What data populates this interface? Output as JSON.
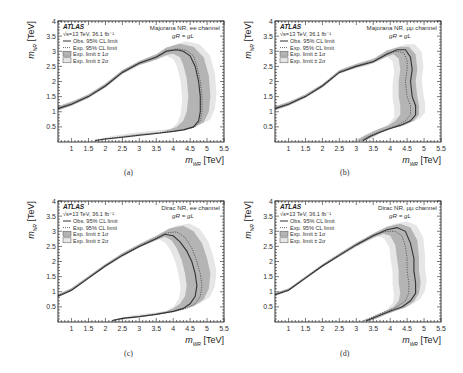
{
  "figure": {
    "captions": [
      "(a)",
      "(b)",
      "(c)",
      "(d)"
    ]
  },
  "common": {
    "experiment": "ATLAS",
    "energy_lumi": "√s=13 TeV, 36.1 fb⁻¹",
    "legend": [
      {
        "key": "obs",
        "label": "Obs. 95% CL limit",
        "style": "solid-line"
      },
      {
        "key": "exp",
        "label": "Exp. 95% CL limit",
        "style": "dotted-line"
      },
      {
        "key": "band1",
        "label": "Exp. limit ± 1σ",
        "style": "dark-box"
      },
      {
        "key": "band2",
        "label": "Exp. limit ± 2σ",
        "style": "light-box"
      }
    ],
    "coupling": "g_R = g_L",
    "coupling_display": "gR = gL",
    "xlabel": "m_{W_R} [TeV]",
    "ylabel": "m_{N_R} [TeV]",
    "xlabel_main": "m",
    "xlabel_sub": "WR",
    "xlabel_unit": "[TeV]",
    "ylabel_main": "m",
    "ylabel_sub": "NR",
    "ylabel_unit": "[TeV]",
    "colors": {
      "band1": "#b4b4b4",
      "band2": "#e6e6e6",
      "obs": "#333333",
      "exp": "#555555",
      "frame": "#222222"
    }
  },
  "chart_data": [
    {
      "type": "line",
      "panel": "(a)",
      "title": "Majorana N_R, ee channel",
      "title_display": "Majorana NR, ee channel",
      "xlabel": "m_{W_R} [TeV]",
      "ylabel": "m_{N_R} [TeV]",
      "xlim": [
        0.6,
        5.5
      ],
      "ylim": [
        0,
        4
      ],
      "xticks": [
        1,
        1.5,
        2,
        2.5,
        3,
        3.5,
        4,
        4.5,
        5,
        5.5
      ],
      "yticks": [
        0.5,
        1,
        1.5,
        2,
        2.5,
        3,
        3.5,
        4
      ],
      "grid": false,
      "legend_position": "upper-left",
      "series": [
        {
          "name": "Obs. 95% CL limit",
          "x": [
            0.6,
            1.0,
            1.5,
            2.0,
            2.5,
            3.0,
            3.5,
            3.8,
            4.1,
            4.3,
            4.5,
            4.65,
            4.75,
            4.8,
            4.8,
            4.75,
            4.6,
            4.3,
            4.0,
            3.5,
            3.0,
            2.5,
            2.0,
            1.7
          ],
          "y": [
            1.1,
            1.25,
            1.5,
            1.85,
            2.3,
            2.6,
            2.8,
            3.0,
            3.05,
            3.0,
            2.85,
            2.5,
            2.0,
            1.5,
            1.0,
            0.7,
            0.5,
            0.4,
            0.35,
            0.28,
            0.22,
            0.16,
            0.1,
            0.05
          ]
        },
        {
          "name": "Exp. 95% CL limit",
          "x": [
            0.6,
            1.0,
            1.5,
            2.0,
            2.5,
            3.0,
            3.5,
            3.8,
            4.15,
            4.4,
            4.6,
            4.7,
            4.8,
            4.85,
            4.85,
            4.8,
            4.65,
            4.35,
            4.0,
            3.5,
            3.0,
            2.5,
            2.0,
            1.7
          ],
          "y": [
            1.12,
            1.27,
            1.52,
            1.87,
            2.32,
            2.62,
            2.82,
            3.02,
            3.08,
            3.02,
            2.85,
            2.5,
            2.0,
            1.5,
            1.0,
            0.7,
            0.5,
            0.4,
            0.36,
            0.29,
            0.23,
            0.17,
            0.11,
            0.06
          ]
        },
        {
          "name": "Exp. limit ± 1σ",
          "lower_x": [
            0.6,
            1.0,
            1.5,
            2.0,
            2.5,
            3.0,
            3.5,
            3.8,
            4.0,
            4.2,
            4.3,
            4.4,
            4.45,
            4.4,
            4.3,
            4.1,
            3.9,
            3.5,
            3.0,
            2.5,
            2.0,
            1.8
          ],
          "lower_y": [
            1.05,
            1.2,
            1.45,
            1.8,
            2.25,
            2.55,
            2.72,
            2.88,
            2.92,
            2.8,
            2.55,
            2.1,
            1.5,
            1.0,
            0.7,
            0.5,
            0.42,
            0.3,
            0.24,
            0.18,
            0.12,
            0.07
          ],
          "upper_x": [
            0.6,
            1.0,
            1.5,
            2.0,
            2.5,
            3.0,
            3.5,
            3.8,
            4.2,
            4.6,
            4.9,
            5.05,
            5.1,
            5.05,
            4.9,
            4.6,
            4.2,
            3.6,
            3.0,
            2.5,
            2.0,
            1.7
          ],
          "upper_y": [
            1.18,
            1.33,
            1.58,
            1.93,
            2.38,
            2.68,
            2.9,
            3.12,
            3.25,
            3.15,
            2.8,
            2.2,
            1.5,
            1.0,
            0.65,
            0.48,
            0.4,
            0.33,
            0.27,
            0.2,
            0.12,
            0.04
          ]
        }
      ]
    },
    {
      "type": "line",
      "panel": "(b)",
      "title": "Majorana N_R, μμ channel",
      "title_display": "Majorana NR, μμ channel",
      "xlabel": "m_{W_R} [TeV]",
      "ylabel": "m_{N_R} [TeV]",
      "xlim": [
        0.6,
        5.5
      ],
      "ylim": [
        0,
        4
      ],
      "xticks": [
        1,
        1.5,
        2,
        2.5,
        3,
        3.5,
        4,
        4.5,
        5,
        5.5
      ],
      "yticks": [
        0.5,
        1,
        1.5,
        2,
        2.5,
        3,
        3.5,
        4
      ],
      "grid": false,
      "legend_position": "upper-left",
      "series": [
        {
          "name": "Obs. 95% CL limit",
          "x": [
            0.6,
            1.0,
            1.5,
            2.0,
            2.5,
            3.0,
            3.5,
            3.9,
            4.2,
            4.45,
            4.6,
            4.65,
            4.6,
            4.65,
            4.75,
            4.75,
            4.6,
            4.3,
            4.0,
            3.7,
            3.4,
            3.2
          ],
          "y": [
            1.1,
            1.25,
            1.5,
            1.85,
            2.3,
            2.5,
            2.65,
            2.9,
            3.05,
            3.05,
            2.8,
            2.4,
            2.0,
            1.5,
            1.2,
            0.9,
            0.7,
            0.55,
            0.45,
            0.32,
            0.18,
            0.05
          ]
        },
        {
          "name": "Exp. 95% CL limit",
          "x": [
            0.6,
            1.0,
            1.5,
            2.0,
            2.5,
            3.0,
            3.5,
            3.9,
            4.2,
            4.4,
            4.5,
            4.5,
            4.45,
            4.5,
            4.6,
            4.6,
            4.45,
            4.2,
            3.95,
            3.65,
            3.35,
            3.15
          ],
          "y": [
            1.12,
            1.27,
            1.52,
            1.87,
            2.32,
            2.52,
            2.67,
            2.92,
            3.0,
            2.95,
            2.7,
            2.4,
            2.0,
            1.5,
            1.2,
            0.9,
            0.7,
            0.55,
            0.45,
            0.32,
            0.18,
            0.05
          ]
        },
        {
          "name": "Exp. limit ± 1σ",
          "lower_x": [
            0.6,
            1.0,
            1.5,
            2.0,
            2.5,
            3.0,
            3.5,
            3.9,
            4.1,
            4.25,
            4.3,
            4.25,
            4.25,
            4.3,
            4.3,
            4.15,
            3.95,
            3.7,
            3.45,
            3.2,
            3.0
          ],
          "lower_y": [
            1.06,
            1.2,
            1.46,
            1.8,
            2.26,
            2.46,
            2.6,
            2.82,
            2.9,
            2.75,
            2.4,
            2.0,
            1.5,
            1.2,
            0.9,
            0.7,
            0.55,
            0.45,
            0.32,
            0.18,
            0.05
          ],
          "upper_x": [
            0.6,
            1.0,
            1.5,
            2.0,
            2.5,
            3.0,
            3.5,
            3.9,
            4.3,
            4.55,
            4.75,
            4.8,
            4.75,
            4.8,
            4.85,
            4.85,
            4.7,
            4.4,
            4.05,
            3.75,
            3.5,
            3.3
          ],
          "upper_y": [
            1.18,
            1.32,
            1.58,
            1.92,
            2.38,
            2.58,
            2.74,
            3.02,
            3.15,
            3.15,
            2.9,
            2.4,
            2.0,
            1.5,
            1.2,
            0.9,
            0.7,
            0.55,
            0.45,
            0.32,
            0.18,
            0.05
          ]
        }
      ]
    },
    {
      "type": "line",
      "panel": "(c)",
      "title": "Dirac N_R, ee channel",
      "title_display": "Dirac NR, ee channel",
      "xlabel": "m_{W_R} [TeV]",
      "ylabel": "m_{N_R} [TeV]",
      "xlim": [
        0.6,
        5.5
      ],
      "ylim": [
        0,
        4
      ],
      "xticks": [
        1,
        1.5,
        2,
        2.5,
        3,
        3.5,
        4,
        4.5,
        5,
        5.5
      ],
      "yticks": [
        0.5,
        1,
        1.5,
        2,
        2.5,
        3,
        3.5,
        4
      ],
      "grid": false,
      "legend_position": "upper-left",
      "series": [
        {
          "name": "Obs. 95% CL limit",
          "x": [
            0.6,
            1.0,
            1.5,
            2.0,
            2.5,
            3.0,
            3.5,
            3.75,
            4.0,
            4.2,
            4.4,
            4.55,
            4.65,
            4.7,
            4.65,
            4.5,
            4.3,
            4.0,
            3.5,
            3.0,
            2.5,
            2.2
          ],
          "y": [
            0.85,
            1.05,
            1.45,
            1.85,
            2.2,
            2.5,
            2.75,
            2.9,
            2.85,
            2.65,
            2.35,
            2.0,
            1.6,
            1.2,
            0.85,
            0.6,
            0.45,
            0.35,
            0.25,
            0.18,
            0.12,
            0.05
          ]
        },
        {
          "name": "Exp. 95% CL limit",
          "x": [
            0.6,
            1.0,
            1.5,
            2.0,
            2.5,
            3.0,
            3.5,
            3.8,
            4.1,
            4.35,
            4.55,
            4.7,
            4.8,
            4.85,
            4.8,
            4.65,
            4.4,
            4.05,
            3.55,
            3.05,
            2.55,
            2.25
          ],
          "y": [
            0.87,
            1.07,
            1.47,
            1.87,
            2.22,
            2.52,
            2.78,
            2.95,
            2.98,
            2.8,
            2.45,
            2.0,
            1.6,
            1.2,
            0.85,
            0.6,
            0.45,
            0.35,
            0.26,
            0.19,
            0.13,
            0.06
          ]
        },
        {
          "name": "Exp. limit ± 1σ",
          "lower_x": [
            0.6,
            1.0,
            1.5,
            2.0,
            2.5,
            3.0,
            3.5,
            3.75,
            3.95,
            4.1,
            4.25,
            4.35,
            4.4,
            4.35,
            4.2,
            4.0,
            3.75,
            3.4,
            3.0,
            2.5,
            2.2
          ],
          "lower_y": [
            0.82,
            1.02,
            1.42,
            1.82,
            2.16,
            2.46,
            2.7,
            2.82,
            2.7,
            2.45,
            2.05,
            1.6,
            1.2,
            0.85,
            0.6,
            0.45,
            0.35,
            0.27,
            0.2,
            0.13,
            0.06
          ],
          "upper_x": [
            0.6,
            1.0,
            1.5,
            2.0,
            2.5,
            3.0,
            3.5,
            3.9,
            4.3,
            4.6,
            4.85,
            5.0,
            5.1,
            5.05,
            4.9,
            4.6,
            4.2,
            3.7,
            3.1,
            2.6,
            2.3
          ],
          "upper_y": [
            0.92,
            1.12,
            1.52,
            1.92,
            2.28,
            2.58,
            2.85,
            3.1,
            3.18,
            3.0,
            2.6,
            2.1,
            1.6,
            1.1,
            0.75,
            0.52,
            0.4,
            0.3,
            0.21,
            0.14,
            0.06
          ]
        }
      ]
    },
    {
      "type": "line",
      "panel": "(d)",
      "title": "Dirac N_R, μμ channel",
      "title_display": "Dirac NR, μμ channel",
      "xlabel": "m_{W_R} [TeV]",
      "ylabel": "m_{N_R} [TeV]",
      "xlim": [
        0.6,
        5.5
      ],
      "ylim": [
        0,
        4
      ],
      "xticks": [
        1,
        1.5,
        2,
        2.5,
        3,
        3.5,
        4,
        4.5,
        5,
        5.5
      ],
      "yticks": [
        0.5,
        1,
        1.5,
        2,
        2.5,
        3,
        3.5,
        4
      ],
      "grid": false,
      "legend_position": "upper-left",
      "series": [
        {
          "name": "Obs. 95% CL limit",
          "x": [
            0.6,
            1.0,
            1.5,
            2.0,
            2.5,
            3.0,
            3.5,
            3.9,
            4.2,
            4.45,
            4.6,
            4.7,
            4.7,
            4.75,
            4.75,
            4.6,
            4.35,
            4.05,
            3.75,
            3.5,
            3.3
          ],
          "y": [
            0.9,
            1.05,
            1.45,
            1.85,
            2.2,
            2.55,
            2.85,
            3.05,
            3.12,
            3.0,
            2.6,
            2.1,
            1.7,
            1.3,
            0.95,
            0.7,
            0.5,
            0.38,
            0.25,
            0.13,
            0.04
          ]
        },
        {
          "name": "Exp. 95% CL limit",
          "x": [
            0.6,
            1.0,
            1.5,
            2.0,
            2.5,
            3.0,
            3.5,
            3.9,
            4.15,
            4.35,
            4.45,
            4.5,
            4.5,
            4.55,
            4.55,
            4.45,
            4.2,
            3.95,
            3.65,
            3.4,
            3.2
          ],
          "y": [
            0.92,
            1.07,
            1.47,
            1.87,
            2.22,
            2.57,
            2.87,
            3.0,
            3.0,
            2.85,
            2.5,
            2.1,
            1.7,
            1.3,
            0.95,
            0.7,
            0.5,
            0.38,
            0.25,
            0.13,
            0.04
          ]
        },
        {
          "name": "Exp. limit ± 1σ",
          "lower_x": [
            0.6,
            1.0,
            1.5,
            2.0,
            2.5,
            3.0,
            3.5,
            3.8,
            4.0,
            4.15,
            4.2,
            4.25,
            4.25,
            4.3,
            4.25,
            4.1,
            3.9,
            3.65,
            3.4,
            3.2
          ],
          "lower_y": [
            0.87,
            1.02,
            1.42,
            1.82,
            2.16,
            2.5,
            2.78,
            2.92,
            2.85,
            2.55,
            2.1,
            1.7,
            1.3,
            0.95,
            0.7,
            0.5,
            0.38,
            0.25,
            0.13,
            0.04
          ],
          "upper_x": [
            0.6,
            1.0,
            1.5,
            2.0,
            2.5,
            3.0,
            3.5,
            3.9,
            4.3,
            4.6,
            4.8,
            4.85,
            4.85,
            4.9,
            4.85,
            4.7,
            4.45,
            4.15,
            3.85,
            3.6,
            3.4
          ],
          "upper_y": [
            0.96,
            1.11,
            1.51,
            1.91,
            2.27,
            2.62,
            2.93,
            3.15,
            3.25,
            3.12,
            2.7,
            2.1,
            1.7,
            1.3,
            0.95,
            0.68,
            0.48,
            0.36,
            0.24,
            0.12,
            0.04
          ]
        }
      ]
    }
  ]
}
